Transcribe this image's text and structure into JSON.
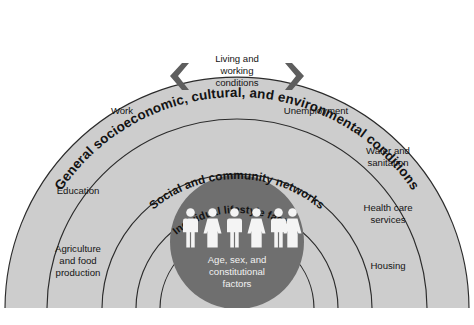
{
  "diagram": {
    "type": "concentric-semicircle-layers",
    "colors": {
      "band_fill": "#cdcdcd",
      "band_stroke": "#2b2b2b",
      "core_fill": "#6f6f6f",
      "core_text": "#f2f2f2",
      "label_text": "#141414",
      "chevron": "#5e5e5e",
      "background": "#ffffff"
    },
    "layers": [
      {
        "id": "outer",
        "curved_label": "General socioeconomic, cultural, and environmental conditions"
      },
      {
        "id": "living-working",
        "curved_label": ""
      },
      {
        "id": "social",
        "curved_label": "Social and community networks"
      },
      {
        "id": "lifestyle",
        "curved_label": "Individual lifestyle factors"
      },
      {
        "id": "core",
        "curved_label": ""
      }
    ],
    "center_block": {
      "line1": "Living and",
      "line2": "working",
      "line3": "conditions"
    },
    "chevrons": {
      "left_name": "chevron-left-icon",
      "right_name": "chevron-right-icon"
    },
    "side_labels_left": [
      {
        "name": "work",
        "lines": [
          "Work"
        ]
      },
      {
        "name": "education",
        "lines": [
          "Education"
        ]
      },
      {
        "name": "agriculture-and-food-production",
        "lines": [
          "Agriculture",
          "and food",
          "production"
        ]
      }
    ],
    "side_labels_right": [
      {
        "name": "unemployment",
        "lines": [
          "Unemployment"
        ]
      },
      {
        "name": "water-and-sanitation",
        "lines": [
          "Water and",
          "sanitation"
        ]
      },
      {
        "name": "health-care-services",
        "lines": [
          "Health care",
          "services"
        ]
      },
      {
        "name": "housing",
        "lines": [
          "Housing"
        ]
      }
    ],
    "core": {
      "lines": [
        "Age, sex, and",
        "constitutional",
        "factors"
      ],
      "figures": [
        "male",
        "female",
        "male",
        "female",
        "male",
        "female"
      ],
      "figure_count": 6
    }
  }
}
